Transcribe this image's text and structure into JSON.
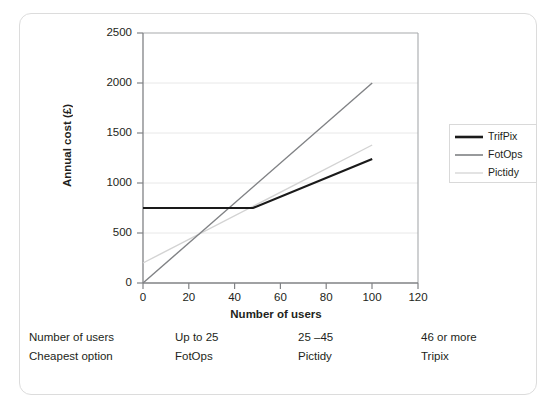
{
  "chart_data": {
    "type": "line",
    "title": "",
    "xlabel": "Number of users",
    "ylabel": "Annual cost (£)",
    "xlim": [
      0,
      120
    ],
    "ylim": [
      0,
      2500
    ],
    "xticks": [
      0,
      20,
      40,
      60,
      80,
      100,
      120
    ],
    "yticks": [
      0,
      500,
      1000,
      1500,
      2000,
      2500
    ],
    "grid": "horizontal",
    "legend_position": "right",
    "series": [
      {
        "name": "TrifPix",
        "color": "#1a1a1a",
        "width": 2.2,
        "points": [
          [
            0,
            750
          ],
          [
            48,
            750
          ],
          [
            100,
            1240
          ]
        ]
      },
      {
        "name": "FotOps",
        "color": "#808285",
        "width": 1.4,
        "points": [
          [
            0,
            0
          ],
          [
            100,
            2000
          ]
        ]
      },
      {
        "name": "Pictidy",
        "color": "#d3d3d3",
        "width": 1.4,
        "points": [
          [
            0,
            200
          ],
          [
            100,
            1380
          ]
        ]
      }
    ]
  },
  "axis": {
    "y_title": "Annual cost (£)",
    "x_title": "Number of users",
    "y_ticks": [
      "2500",
      "2000",
      "1500",
      "1000",
      "500",
      "0"
    ],
    "x_ticks": [
      "0",
      "20",
      "40",
      "60",
      "80",
      "100",
      "120"
    ]
  },
  "legend": {
    "items": [
      {
        "label": "TrifPix",
        "color": "#1a1a1a"
      },
      {
        "label": "FotOps",
        "color": "#808285"
      },
      {
        "label": "Pictidy",
        "color": "#d9d9d9"
      }
    ]
  },
  "table": {
    "rows": [
      {
        "header": "Number of users",
        "c1": "Up to 25",
        "c2": "25 –45",
        "c3": "46 or more"
      },
      {
        "header": "Cheapest option",
        "c1": "FotOps",
        "c2": "Pictidy",
        "c3": "Tripix"
      }
    ]
  },
  "colors": {
    "frame": "#dcdcdc",
    "axis": "#808285",
    "grid": "#e8e8e8",
    "text": "#231f20"
  }
}
